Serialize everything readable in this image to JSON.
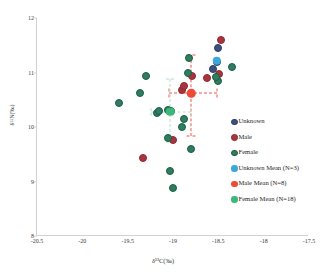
{
  "chart_data": {
    "type": "scatter",
    "title": "",
    "xlabel": "δ¹³C(‰)",
    "ylabel": "δ¹⁵N(‰)",
    "xlim": [
      -20.5,
      -17.5
    ],
    "ylim": [
      8,
      12
    ],
    "xticks": [
      "-20.5",
      "-20",
      "-19.5",
      "-19",
      "-18.5",
      "-18",
      "-17.5"
    ],
    "xtick_values": [
      -20.5,
      -20,
      -19.5,
      -19,
      -18.5,
      -18,
      -17.5
    ],
    "yticks": [
      "8",
      "9",
      "10",
      "11",
      "12"
    ],
    "ytick_values": [
      8,
      9,
      10,
      11,
      12
    ],
    "grid": false,
    "legend_position": "right-inside",
    "series": [
      {
        "name": "Unknown",
        "marker": "circle-outlined",
        "color": "#2c3e66",
        "fill": "#3d4f7c",
        "points": [
          {
            "x": -18.5,
            "y": 11.45
          },
          {
            "x": -18.52,
            "y": 11.2
          },
          {
            "x": -18.56,
            "y": 11.07
          }
        ]
      },
      {
        "name": "Male",
        "marker": "circle-outlined",
        "color": "#8b2a32",
        "fill": "#a8353d",
        "points": [
          {
            "x": -18.47,
            "y": 11.6
          },
          {
            "x": -18.79,
            "y": 10.93
          },
          {
            "x": -18.62,
            "y": 10.9
          },
          {
            "x": -18.49,
            "y": 10.97
          },
          {
            "x": -18.9,
            "y": 10.68
          },
          {
            "x": -19.0,
            "y": 9.77
          },
          {
            "x": -19.33,
            "y": 9.43
          },
          {
            "x": -18.88,
            "y": 10.75
          }
        ]
      },
      {
        "name": "Female",
        "marker": "circle-outlined",
        "color": "#1f5c46",
        "fill": "#2e7d5e",
        "points": [
          {
            "x": -18.82,
            "y": 11.27
          },
          {
            "x": -18.84,
            "y": 11.0
          },
          {
            "x": -18.35,
            "y": 11.1
          },
          {
            "x": -18.5,
            "y": 10.85
          },
          {
            "x": -18.53,
            "y": 10.92
          },
          {
            "x": -19.3,
            "y": 10.93
          },
          {
            "x": -19.36,
            "y": 10.63
          },
          {
            "x": -19.6,
            "y": 10.44
          },
          {
            "x": -19.18,
            "y": 10.25
          },
          {
            "x": -19.15,
            "y": 10.3
          },
          {
            "x": -19.06,
            "y": 10.31
          },
          {
            "x": -19.02,
            "y": 10.29
          },
          {
            "x": -18.88,
            "y": 10.15
          },
          {
            "x": -18.9,
            "y": 10.0
          },
          {
            "x": -19.05,
            "y": 9.8
          },
          {
            "x": -18.8,
            "y": 9.6
          },
          {
            "x": -19.03,
            "y": 9.2
          },
          {
            "x": -19.0,
            "y": 8.88
          }
        ]
      },
      {
        "name": "Unknown Mean (N=3)",
        "marker": "circle-filled",
        "color": "#3aa8dc",
        "points": [
          {
            "x": -18.52,
            "y": 11.22
          }
        ],
        "n": 3
      },
      {
        "name": "Male Mean (N=8)",
        "marker": "circle-filled",
        "color": "#ef4a35",
        "points": [
          {
            "x": -18.8,
            "y": 10.62
          }
        ],
        "n": 8,
        "error": {
          "x_minus": -19.04,
          "x_plus": -18.51,
          "y_minus": 9.83,
          "y_plus": 11.32
        }
      },
      {
        "name": "Female Mean (N=18)",
        "marker": "circle-filled",
        "color": "#3cb878",
        "points": [
          {
            "x": -19.03,
            "y": 10.28
          }
        ],
        "n": 18,
        "error": {
          "x_minus": -19.24,
          "x_plus": -18.8,
          "y_minus": 9.72,
          "y_plus": 10.88
        }
      }
    ]
  },
  "legend": {
    "items": [
      {
        "label": "Unknown",
        "swatch": "unknown-swatch"
      },
      {
        "label": "Male",
        "swatch": "male-swatch"
      },
      {
        "label": "Female",
        "swatch": "female-swatch"
      },
      {
        "label": "Unknown Mean (N=3)",
        "swatch": "unknown-mean-swatch"
      },
      {
        "label": "Male Mean (N=8)",
        "swatch": "male-mean-swatch"
      },
      {
        "label": "Female Mean (N=18)",
        "swatch": "female-mean-swatch"
      }
    ]
  },
  "colors": {
    "unknown_border": "#2c3e66",
    "unknown_fill": "#3d4f7c",
    "male_border": "#8b2a32",
    "male_fill": "#a8353d",
    "female_border": "#1f5c46",
    "female_fill": "#2e7d5e",
    "unknown_mean": "#3aa8dc",
    "male_mean": "#ef4a35",
    "female_mean": "#3cb878",
    "male_error": "#f0574a",
    "female_error": "#b9dcc4",
    "axis": "#d2d2d2"
  }
}
